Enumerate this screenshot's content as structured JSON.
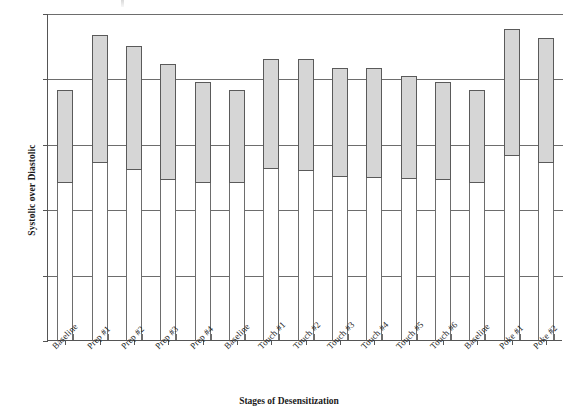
{
  "chart_data": {
    "type": "bar",
    "title": "",
    "xlabel": "Stages of Desensitization",
    "ylabel": "Systolic over Diastolic",
    "ylim": [
      0,
      250
    ],
    "yticks": [
      0,
      50,
      100,
      150,
      200,
      250
    ],
    "grid": true,
    "legend": "none",
    "bar_style": "floating range bar (diastolic to systolic)",
    "categories": [
      "Baseline",
      "Prep #1",
      "Prep #2",
      "Prep #3",
      "Prep #4",
      "Baseline",
      "Touch #1",
      "Touch #2",
      "Touch #3",
      "Touch #4",
      "Touch #5",
      "Touch #6",
      "Baseline",
      "Poke #1",
      "Poke #2"
    ],
    "series": [
      {
        "name": "Systolic",
        "values": [
          191,
          233,
          225,
          211,
          197,
          191,
          215,
          215,
          208,
          208,
          202,
          197,
          191,
          238,
          231
        ]
      },
      {
        "name": "Diastolic",
        "values": [
          120,
          135,
          130,
          122,
          120,
          120,
          131,
          129,
          125,
          124,
          123,
          122,
          120,
          141,
          135
        ]
      }
    ],
    "colors": {
      "bar_fill": "#d6d6d6",
      "bar_border": "#5a5a5a",
      "grid": "#6d6d6d",
      "axis": "#555555",
      "background": "#ffffff"
    }
  }
}
